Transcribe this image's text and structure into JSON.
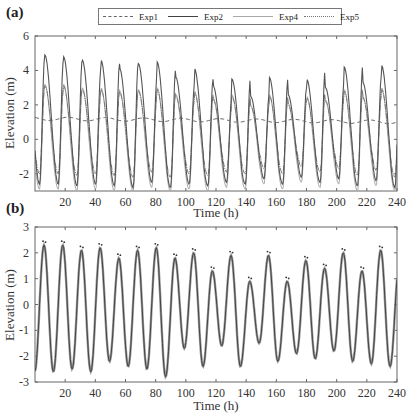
{
  "chart_data": [
    {
      "panel": "(a)",
      "type": "line",
      "title": "",
      "xlabel": "Time (h)",
      "ylabel": "Elevation (m)",
      "xlim": [
        0,
        240
      ],
      "ylim": [
        -3,
        6
      ],
      "xticks": [
        20,
        40,
        60,
        80,
        100,
        120,
        140,
        160,
        180,
        200,
        220,
        240
      ],
      "yticks": [
        -2,
        0,
        2,
        4,
        6
      ],
      "grid": false,
      "legend": {
        "position": "top",
        "entries": [
          "Exp1",
          "Exp2",
          "Exp4",
          "Exp5"
        ]
      },
      "period_h": 12.4,
      "first_peak_h": 6.5,
      "series": [
        {
          "name": "Exp1",
          "style": "dashed",
          "description": "nearly flat, ~1.1-1.4 m, slight oscillation",
          "mean": 1.2,
          "amplitude": 0.12
        },
        {
          "name": "Exp2",
          "style": "solid",
          "peaks": [
            4.9,
            4.8,
            4.6,
            4.6,
            4.1,
            4.4,
            4.5,
            3.6,
            4.1,
            3.1,
            3.5,
            2.5,
            3.6,
            2.6,
            3.5,
            3.0,
            4.2,
            3.3,
            4.3,
            3.7,
            4.6,
            4.0
          ],
          "troughs": [
            -2.6,
            -2.7,
            -2.6,
            -2.7,
            -2.8,
            -2.5,
            -2.8,
            -2.6,
            -2.7,
            -2.5,
            -2.6,
            -2.3,
            -2.6,
            -2.2,
            -2.5,
            -2.3,
            -2.7,
            -2.4,
            -2.8,
            -2.6,
            -2.9,
            -2.7
          ]
        },
        {
          "name": "Exp4",
          "style": "solid-light",
          "peaks": [
            3.2,
            3.2,
            3.0,
            3.0,
            2.8,
            2.9,
            3.0,
            2.6,
            2.8,
            2.4,
            2.6,
            2.0,
            2.6,
            2.1,
            2.5,
            2.3,
            2.9,
            2.5,
            3.0,
            2.7,
            3.1,
            2.8
          ],
          "troughs": [
            -2.9,
            -3.0,
            -2.9,
            -3.0,
            -3.0,
            -2.8,
            -3.0,
            -2.9,
            -3.0,
            -2.8,
            -2.9,
            -2.6,
            -2.9,
            -2.5,
            -2.8,
            -2.6,
            -3.0,
            -2.7,
            -3.0,
            -2.9,
            -3.0,
            -3.0
          ]
        },
        {
          "name": "Exp5",
          "style": "dash-dot",
          "peaks": [
            3.1,
            3.1,
            2.9,
            2.9,
            2.7,
            2.8,
            2.9,
            2.5,
            2.7,
            2.3,
            2.5,
            1.9,
            2.5,
            2.0,
            2.4,
            2.2,
            2.8,
            2.4,
            2.9,
            2.6,
            3.0,
            2.7
          ],
          "troughs": [
            -2.0,
            -2.1,
            -2.0,
            -2.1,
            -2.2,
            -1.9,
            -2.2,
            -2.0,
            -2.1,
            -1.9,
            -2.0,
            -1.7,
            -2.0,
            -1.6,
            -1.9,
            -1.7,
            -2.1,
            -1.8,
            -2.2,
            -2.0,
            -2.3,
            -2.1
          ]
        }
      ]
    },
    {
      "panel": "(b)",
      "type": "line",
      "title": "",
      "xlabel": "Time (h)",
      "ylabel": "Elevation (m)",
      "xlim": [
        0,
        240
      ],
      "ylim": [
        -3,
        3
      ],
      "xticks": [
        20,
        40,
        60,
        80,
        100,
        120,
        140,
        160,
        180,
        200,
        220,
        240
      ],
      "yticks": [
        -3,
        -2,
        -1,
        0,
        1,
        2,
        3
      ],
      "grid": false,
      "period_h": 12.4,
      "first_peak_h": 6.0,
      "series": [
        {
          "name": "Model",
          "style": "solid",
          "peaks": [
            2.3,
            2.3,
            2.1,
            2.2,
            1.8,
            2.1,
            2.2,
            1.8,
            2.0,
            1.3,
            1.9,
            0.9,
            1.9,
            0.9,
            1.7,
            1.4,
            2.0,
            1.3,
            2.1,
            1.6,
            2.3,
            1.9
          ],
          "troughs": [
            -2.6,
            -2.5,
            -2.6,
            -2.2,
            -2.4,
            -2.5,
            -2.8,
            -1.7,
            -2.4,
            -1.6,
            -2.4,
            -1.5,
            -2.2,
            -1.9,
            -2.1,
            -1.8,
            -2.2,
            -2.3,
            -2.4,
            -2.7,
            -2.3,
            -2.9
          ]
        },
        {
          "name": "Observed",
          "style": "points",
          "description": "small point markers near each crest, slightly above model peaks"
        }
      ]
    }
  ],
  "panels": {
    "a": {
      "label": "(a)",
      "xlabel": "Time (h)",
      "ylabel": "Elevation (m)"
    },
    "b": {
      "label": "(b)",
      "xlabel": "Time (h)",
      "ylabel": "Elevation (m)"
    }
  },
  "legend": {
    "items": [
      "Exp1",
      "Exp2",
      "Exp4",
      "Exp5"
    ]
  }
}
